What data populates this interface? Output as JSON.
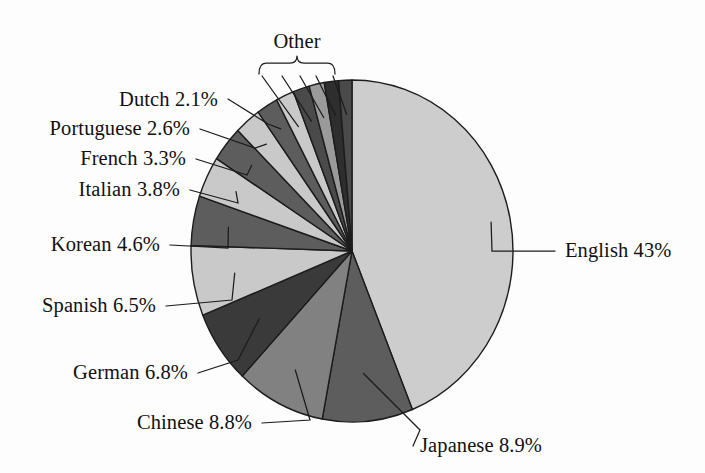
{
  "figure": {
    "title": "",
    "background_color": "#fdfdfd",
    "outline_color": "#1c1c1c"
  },
  "other_group": {
    "label": "Other",
    "bracket_slice_count": 5
  },
  "labels": {
    "english": "English 43%",
    "japanese": "Japanese 8.9%",
    "chinese": "Chinese 8.8%",
    "german": "German 6.8%",
    "spanish": "Spanish 6.5%",
    "korean": "Korean 4.6%",
    "italian": "Italian 3.8%",
    "french": "French 3.3%",
    "portuguese": "Portuguese 2.6%",
    "dutch": "Dutch 2.1%",
    "other": "Other"
  },
  "chart_data": {
    "type": "pie",
    "title": "",
    "xlabel": "",
    "ylabel": "",
    "start_angle_deg": 0,
    "direction": "clockwise",
    "center": [
      352,
      251
    ],
    "radius_x": 161,
    "radius_y": 171,
    "units": "percent",
    "total": 100,
    "legend_position": "callout-labels",
    "grid": false,
    "categories": [
      "English",
      "Japanese",
      "Chinese",
      "German",
      "Spanish",
      "Korean",
      "Italian",
      "French",
      "Portuguese",
      "Dutch",
      "Other"
    ],
    "values": [
      43,
      8.9,
      8.8,
      6.8,
      6.5,
      4.6,
      3.8,
      3.3,
      2.6,
      2.1,
      7.6
    ],
    "value_labels": [
      "43%",
      "8.9%",
      "8.8%",
      "6.8%",
      "6.5%",
      "4.6%",
      "3.8%",
      "3.3%",
      "2.6%",
      "2.1%",
      ""
    ],
    "slice_colors": [
      "#cdcdcd",
      "#5d5d5d",
      "#818181",
      "#3a3a3a",
      "#c9c9c9",
      "#5d5d5d",
      "#c9c9c9",
      "#5d5d5d",
      "#c9c9c9",
      "#5d5d5d",
      "#3a3a3a"
    ],
    "other_subslices": {
      "count": 5,
      "values": [
        1.8,
        1.6,
        1.5,
        1.4,
        1.3
      ],
      "colors": [
        "#c9c9c9",
        "#4a4a4a",
        "#9a9a9a",
        "#2e2e2e",
        "#4a4a4a"
      ]
    }
  }
}
